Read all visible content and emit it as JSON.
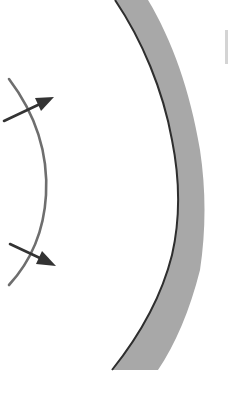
{
  "diagram": {
    "colors": {
      "background": "#ffffff",
      "band_fill": "#a8a8a8",
      "band_edge": "#2e2e2e",
      "wavefront": "#6e6e6e",
      "arrow": "#333333",
      "edge_artifact": "#b8b8b8"
    },
    "elements": {
      "curved_surface": {
        "label": ""
      },
      "wavefront": {
        "label": ""
      },
      "arrow_upper": {
        "label": ""
      },
      "arrow_lower": {
        "label": ""
      }
    },
    "text_labels": []
  }
}
